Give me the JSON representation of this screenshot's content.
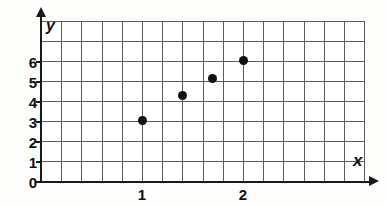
{
  "chart_data": {
    "type": "scatter",
    "title": "",
    "xlabel": "x",
    "ylabel": "y",
    "xlim": [
      -0.2,
      3.0
    ],
    "ylim": [
      0,
      8
    ],
    "grid": true,
    "legend": null,
    "x_ticks": [
      {
        "value": 1,
        "label": "1"
      },
      {
        "value": 2,
        "label": "2"
      }
    ],
    "y_ticks": [
      {
        "value": 0,
        "label": "0"
      },
      {
        "value": 1,
        "label": "1"
      },
      {
        "value": 2,
        "label": "2"
      },
      {
        "value": 3,
        "label": "3"
      },
      {
        "value": 4,
        "label": "4"
      },
      {
        "value": 5,
        "label": "5"
      },
      {
        "value": 6,
        "label": "6"
      }
    ],
    "points": [
      {
        "x": 1.0,
        "y": 3.0
      },
      {
        "x": 1.4,
        "y": 4.25
      },
      {
        "x": 1.7,
        "y": 5.1
      },
      {
        "x": 2.0,
        "y": 6.0
      }
    ],
    "marker": "filled-circle",
    "marker_color": "#111111",
    "grid_color": "#5b5b5b",
    "axis_color": "#1a1a1a",
    "background_color": "#ffffff"
  },
  "axes": {
    "x_name": "x",
    "y_name": "y"
  }
}
